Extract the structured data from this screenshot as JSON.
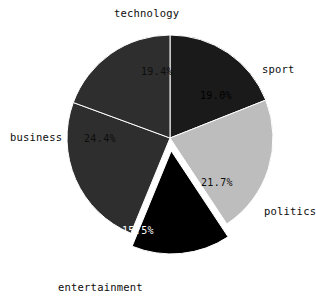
{
  "chart_data": {
    "type": "pie",
    "title": "",
    "subtitle": "",
    "xlabel": "",
    "ylabel": "",
    "legend_position": "none",
    "grid": false,
    "autopct_format": "%.1f%%",
    "start_angle_deg": 90,
    "direction": "clockwise",
    "categories": [
      "sport",
      "politics",
      "entertainment",
      "business",
      "technology"
    ],
    "values": [
      19.0,
      21.7,
      15.5,
      24.4,
      19.4
    ],
    "slices": [
      {
        "label": "sport",
        "pct_text": "19.0%",
        "value": 19.0,
        "color": "#1a1a1a",
        "pct_text_color": "#000000",
        "exploded": false,
        "label_x": 262,
        "label_y": 70,
        "label_anchor": "start",
        "pct_x": 216,
        "pct_y": 96
      },
      {
        "label": "politics",
        "pct_text": "21.7%",
        "value": 21.7,
        "color": "#bdbdbd",
        "pct_text_color": "#0d0d0d",
        "exploded": false,
        "label_x": 264,
        "label_y": 212,
        "label_anchor": "start",
        "pct_x": 217,
        "pct_y": 183
      },
      {
        "label": "entertainment",
        "pct_text": "15.5%",
        "value": 15.5,
        "color": "#000000",
        "pct_text_color": "#ffffff",
        "exploded": true,
        "label_x": 58,
        "label_y": 288,
        "label_anchor": "start",
        "pct_x": 138,
        "pct_y": 231
      },
      {
        "label": "business",
        "pct_text": "24.4%",
        "value": 24.4,
        "color": "#2e2e2e",
        "pct_text_color": "#0d0d0d",
        "exploded": false,
        "label_x": 10,
        "label_y": 138,
        "label_anchor": "start",
        "pct_x": 100,
        "pct_y": 139
      },
      {
        "label": "technology",
        "pct_text": "19.4%",
        "value": 19.4,
        "color": "#2e2e2e",
        "pct_text_color": "#0d0d0d",
        "exploded": false,
        "label_x": 114,
        "label_y": 14,
        "label_anchor": "start",
        "pct_x": 157,
        "pct_y": 72
      }
    ],
    "geometry": {
      "center_x": 170,
      "center_y": 138,
      "radius": 103,
      "explode_offset": 13
    },
    "background_color": "#ffffff"
  }
}
